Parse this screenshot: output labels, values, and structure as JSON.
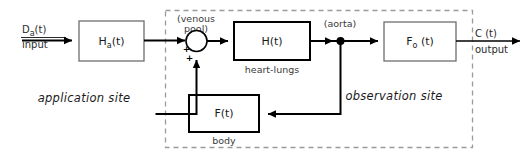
{
  "diagram": {
    "regions": [
      {
        "id": "application-site",
        "label": "application site",
        "style": "italic"
      },
      {
        "id": "observation-site",
        "label": "observation site",
        "style": "italic",
        "boundary": "dashed"
      }
    ],
    "blocks": [
      {
        "id": "ha",
        "label": "H",
        "subscript": "a",
        "suffix": "(t)",
        "full_label": "Ha(t)",
        "caption": ""
      },
      {
        "id": "h",
        "label": "H",
        "subscript": "",
        "suffix": "(t)",
        "full_label": "H(t)",
        "caption": "heart-lungs"
      },
      {
        "id": "fo",
        "label": "F",
        "subscript": "o",
        "suffix": " (t)",
        "full_label": "Fo (t)",
        "caption": ""
      },
      {
        "id": "f",
        "label": "F",
        "subscript": "",
        "suffix": "(t)",
        "full_label": "F(t)",
        "caption": "body"
      }
    ],
    "junctions": [
      {
        "id": "venous-pool",
        "type": "summing",
        "label_line1": "(venous",
        "label_line2": "pool)",
        "sign_horizontal": "+",
        "sign_vertical": "+"
      },
      {
        "id": "aorta",
        "type": "tap",
        "label": "(aorta)"
      }
    ],
    "signals": [
      {
        "id": "input",
        "name": "Da(t)",
        "name_base": "D",
        "name_sub": "a",
        "name_suffix": "(t)",
        "role": "input"
      },
      {
        "id": "output",
        "name": "C (t)",
        "name_base": "C (t)",
        "name_sub": "",
        "name_suffix": "",
        "role": "output"
      }
    ],
    "colors": {
      "wire": "#000000",
      "box_stroke": "#000000",
      "box_fill": "#ffffff",
      "dashed_stroke": "#9a9a9a",
      "text": "#1a1a1a",
      "annotation_text": "#3a3a3a",
      "background": "#ffffff"
    }
  }
}
